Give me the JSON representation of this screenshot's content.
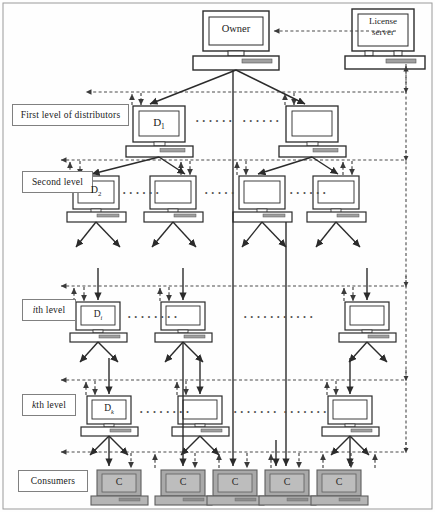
{
  "diagram": {
    "colors": {
      "stroke": "#2b2b2b",
      "dashed": "#4a4a4a",
      "label_border": "#808080",
      "consumer_fill": "#a9a9a9",
      "consumer_shade": "#bdbdbd",
      "screen_fill": "#ffffff",
      "text": "#1a1a1a"
    },
    "level_labels": [
      {
        "id": "first-level",
        "text": "First level of distributors",
        "x": 12,
        "y": 104,
        "w": 117,
        "h": 22
      },
      {
        "id": "second-level",
        "text": "Second level",
        "x": 22,
        "y": 171,
        "w": 71,
        "h": 22
      },
      {
        "id": "ith-level",
        "text": "ith level",
        "x": 22,
        "y": 299,
        "w": 54,
        "h": 22,
        "italic_prefix": "i"
      },
      {
        "id": "kth-level",
        "text": "kth level",
        "x": 22,
        "y": 394,
        "w": 54,
        "h": 22,
        "italic_prefix": "k"
      },
      {
        "id": "consumers",
        "text": "Consumers",
        "x": 18,
        "y": 470,
        "w": 70,
        "h": 22
      }
    ],
    "nodes": {
      "owner": {
        "label": "Owner",
        "x": 203,
        "y": 11,
        "w": 66,
        "h": 40
      },
      "license_server": {
        "label": "License server",
        "line1": "License",
        "line2": "server",
        "x": 352,
        "y": 9,
        "w": 62,
        "h": 42
      },
      "first_level": [
        {
          "label": "D",
          "sub": "1",
          "x": 133,
          "y": 106,
          "w": 52,
          "h": 36
        },
        {
          "label": "",
          "sub": "",
          "x": 286,
          "y": 106,
          "w": 52,
          "h": 36
        }
      ],
      "second_level": [
        {
          "label": "D",
          "sub": "2",
          "x": 73,
          "y": 176,
          "w": 46,
          "h": 33
        },
        {
          "label": "",
          "sub": "",
          "x": 150,
          "y": 176,
          "w": 46,
          "h": 33
        },
        {
          "label": "",
          "sub": "",
          "x": 239,
          "y": 176,
          "w": 46,
          "h": 33
        },
        {
          "label": "",
          "sub": "",
          "x": 313,
          "y": 176,
          "w": 46,
          "h": 33
        }
      ],
      "ith_level": [
        {
          "label": "D",
          "sub": "i",
          "italic_sub": true,
          "x": 76,
          "y": 302,
          "w": 44,
          "h": 30
        },
        {
          "label": "",
          "sub": "",
          "x": 161,
          "y": 302,
          "w": 44,
          "h": 30
        },
        {
          "label": "",
          "sub": "",
          "x": 345,
          "y": 302,
          "w": 44,
          "h": 30
        }
      ],
      "kth_level": [
        {
          "label": "D",
          "sub": "k",
          "italic_sub": true,
          "x": 87,
          "y": 396,
          "w": 44,
          "h": 30
        },
        {
          "label": "",
          "sub": "",
          "x": 178,
          "y": 396,
          "w": 44,
          "h": 30
        },
        {
          "label": "",
          "sub": "",
          "x": 328,
          "y": 396,
          "w": 44,
          "h": 30
        }
      ],
      "consumers": [
        {
          "label": "C",
          "x": 97,
          "y": 470,
          "w": 44,
          "h": 30
        },
        {
          "label": "C",
          "x": 161,
          "y": 470,
          "w": 44,
          "h": 30
        },
        {
          "label": "C",
          "x": 213,
          "y": 470,
          "w": 44,
          "h": 30
        },
        {
          "label": "C",
          "x": 265,
          "y": 470,
          "w": 44,
          "h": 30
        },
        {
          "label": "C",
          "x": 317,
          "y": 470,
          "w": 44,
          "h": 30
        }
      ]
    },
    "ellipses": [
      {
        "id": "dots-l1-a",
        "x": 196,
        "y": 117,
        "text": "• • • • • •"
      },
      {
        "id": "dots-l1-b",
        "x": 243,
        "y": 117,
        "text": "• • • • • •"
      },
      {
        "id": "dots-l2-a",
        "x": 123,
        "y": 189,
        "text": "• • • • • •"
      },
      {
        "id": "dots-l2-b",
        "x": 203,
        "y": 189,
        "text": "• • • • •"
      },
      {
        "id": "dots-l2-c",
        "x": 288,
        "y": 189,
        "text": "• • • • • •"
      },
      {
        "id": "dots-li-a",
        "x": 128,
        "y": 313,
        "text": "• • • • • • • •"
      },
      {
        "id": "dots-li-b",
        "x": 244,
        "y": 313,
        "text": "• • • • • • • • • • •"
      },
      {
        "id": "dots-lk-a",
        "x": 140,
        "y": 408,
        "text": "• • • • • • • •"
      },
      {
        "id": "dots-lk-b",
        "x": 232,
        "y": 408,
        "text": "• • • • • • •"
      },
      {
        "id": "dots-lk-c",
        "x": 282,
        "y": 408,
        "text": "• • • • • • •"
      }
    ],
    "bus_lines": [
      {
        "id": "bus-first",
        "y": 92,
        "x1": 85,
        "x2": 406
      },
      {
        "id": "bus-second",
        "y": 160,
        "x1": 60,
        "x2": 406
      },
      {
        "id": "bus-ith",
        "y": 286,
        "x1": 60,
        "x2": 406
      },
      {
        "id": "bus-kth",
        "y": 380,
        "x1": 60,
        "x2": 406
      },
      {
        "id": "bus-consumers",
        "y": 452,
        "x1": 60,
        "x2": 406
      }
    ],
    "vertical_dashed_trunk": {
      "id": "license-trunk",
      "x": 406,
      "y1": 64,
      "y2": 452
    }
  }
}
